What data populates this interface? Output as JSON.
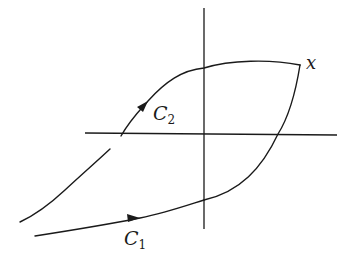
{
  "diagram": {
    "type": "hysteresis-loop",
    "colors": {
      "stroke": "#1a1a1a",
      "background": "#ffffff"
    },
    "labels": {
      "point_x": "x",
      "c2_main": "C",
      "c2_sub": "2",
      "c1_main": "C",
      "c1_sub": "1"
    },
    "elements": {
      "axes": [
        "horizontal-axis",
        "vertical-axis"
      ],
      "curves": [
        {
          "name": "C1",
          "description": "lower branch with rightward arrow, rising to point x"
        },
        {
          "name": "C2",
          "description": "upper branch with upward arrow, from left through top to point x"
        }
      ],
      "arrows": [
        "arrow on C1 pointing right",
        "arrow on C2 pointing up-right"
      ]
    }
  }
}
